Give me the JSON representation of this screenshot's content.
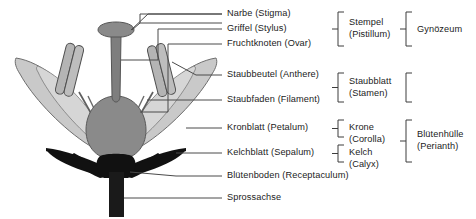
{
  "diagram": {
    "language": "de",
    "background_color": "#ffffff",
    "line_color": "#4a4a4a",
    "text_color": "#1b1b1b",
    "colors": {
      "petal_fill": "#c9c9c9",
      "petal_stroke": "#6e6e6e",
      "sepal_fill": "#111111",
      "ovary_fill": "#8a8a8a",
      "ovary_stroke": "#5a5a5a",
      "style_fill": "#7e7e7e",
      "style_stroke": "#555555",
      "anther_fill": "#b4b4b4",
      "anther_stroke": "#4f4f4f",
      "filament_stroke": "#5f5f5f",
      "receptacle_fill": "#111111",
      "stem_fill": "#1a1a1a"
    },
    "parts": [
      {
        "key": "stigma",
        "label": "Narbe (Stigma)",
        "leader_y": 14,
        "text_x": 227
      },
      {
        "key": "style",
        "label": "Griffel (Stylus)",
        "leader_y": 29,
        "text_x": 227
      },
      {
        "key": "ovary",
        "label": "Fruchtknoten (Ovar)",
        "leader_y": 44,
        "text_x": 227
      },
      {
        "key": "anther",
        "label": "Staubbeutel (Anthere)",
        "leader_y": 75,
        "text_x": 227
      },
      {
        "key": "filament",
        "label": "Staubfaden (Filament)",
        "leader_y": 100,
        "text_x": 227
      },
      {
        "key": "petal",
        "label": "Kronblatt (Petalum)",
        "leader_y": 128,
        "text_x": 227
      },
      {
        "key": "sepal",
        "label": "Kelchblatt (Sepalum)",
        "leader_y": 153,
        "text_x": 227
      },
      {
        "key": "receptacle",
        "label": "Blütenboden (Receptaculum)",
        "leader_y": 176,
        "text_x": 227
      },
      {
        "key": "shoot_axis",
        "label": "Sprossachse",
        "leader_y": 198,
        "text_x": 227
      }
    ],
    "groups_level1": [
      {
        "key": "pistil",
        "line1": "Stempel",
        "line2": "(Pistillum)",
        "spans": [
          "stigma",
          "style",
          "ovary"
        ]
      },
      {
        "key": "stamen",
        "line1": "Staubblatt",
        "line2": "(Stamen)",
        "spans": [
          "anther",
          "filament"
        ]
      },
      {
        "key": "corolla",
        "line1": "Krone",
        "line2": "(Corolla)",
        "spans": [
          "petal"
        ]
      },
      {
        "key": "calyx",
        "line1": "Kelch",
        "line2": "(Calyx)",
        "spans": [
          "sepal"
        ]
      }
    ],
    "groups_level2": [
      {
        "key": "gynoecium",
        "line1": "Gynözeum",
        "line2": "",
        "spans": [
          "pistil"
        ]
      },
      {
        "key": "perianth",
        "line1": "Blütenhülle",
        "line2": "(Perianth)",
        "spans": [
          "corolla",
          "calyx"
        ]
      }
    ]
  }
}
